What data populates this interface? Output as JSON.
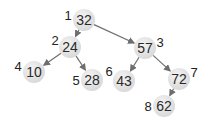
{
  "diagram": {
    "type": "binary-tree",
    "edge_color": "#6e6e6e",
    "nodes": [
      {
        "id": 1,
        "value": "32",
        "order_label": "1",
        "x": 84,
        "y": 20,
        "lx": 68,
        "ly": 15
      },
      {
        "id": 2,
        "value": "24",
        "order_label": "2",
        "x": 70,
        "y": 47,
        "lx": 55,
        "ly": 40
      },
      {
        "id": 3,
        "value": "57",
        "order_label": "3",
        "x": 145,
        "y": 48,
        "lx": 160,
        "ly": 42
      },
      {
        "id": 4,
        "value": "10",
        "order_label": "4",
        "x": 34,
        "y": 72,
        "lx": 18,
        "ly": 66
      },
      {
        "id": 5,
        "value": "28",
        "order_label": "5",
        "x": 92,
        "y": 80,
        "lx": 76,
        "ly": 80
      },
      {
        "id": 6,
        "value": "43",
        "order_label": "6",
        "x": 124,
        "y": 81,
        "lx": 109,
        "ly": 71
      },
      {
        "id": 7,
        "value": "72",
        "order_label": "7",
        "x": 179,
        "y": 79,
        "lx": 194,
        "ly": 72
      },
      {
        "id": 8,
        "value": "62",
        "order_label": "8",
        "x": 164,
        "y": 106,
        "lx": 148,
        "ly": 106
      }
    ],
    "edges": [
      {
        "from": 1,
        "to": 2
      },
      {
        "from": 1,
        "to": 3
      },
      {
        "from": 2,
        "to": 4
      },
      {
        "from": 2,
        "to": 5
      },
      {
        "from": 3,
        "to": 6
      },
      {
        "from": 3,
        "to": 7
      },
      {
        "from": 7,
        "to": 8
      }
    ]
  }
}
